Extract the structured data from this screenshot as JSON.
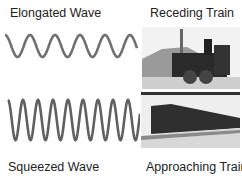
{
  "labels": {
    "elongated": "Elongated Wave",
    "receding": "Receding Train",
    "squeezed": "Squeezed Wave",
    "approaching": "Approaching Train"
  },
  "waves": {
    "elongated": {
      "period_px": 25,
      "amplitude_px": 11,
      "color": "#707070"
    },
    "squeezed": {
      "period_px": 15,
      "amplitude_px": 20,
      "color": "#606060"
    }
  },
  "images": {
    "top": "receding steam locomotive photo (grayscale)",
    "bottom": "approaching steam train with freight cars photo (grayscale)"
  }
}
